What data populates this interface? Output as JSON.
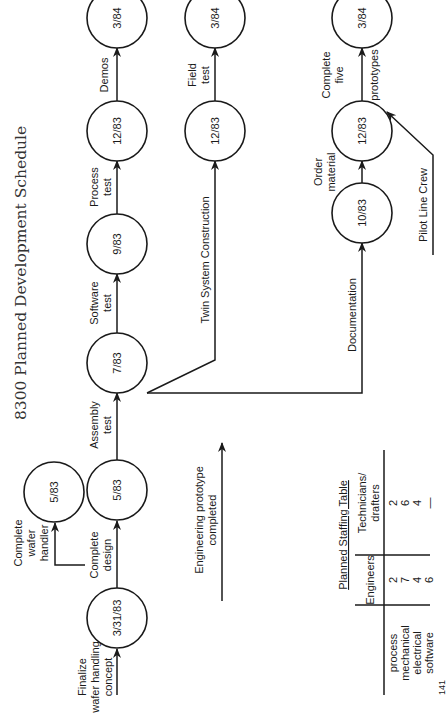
{
  "title": "8300 Planned Development Schedule",
  "orientation": "rotated-90-ccw",
  "nodes": {
    "finalize": "3/31/83",
    "wafer_handler": "5/83",
    "design": "5/83",
    "assembly": "7/83",
    "software": "9/83",
    "process": "12/83",
    "demos": "3/84",
    "twin": "12/83",
    "field": "3/84",
    "documentation": "10/83",
    "order": "12/83",
    "prototypes": "3/84"
  },
  "activities": {
    "finalize": [
      "Finalize",
      "wafer handling",
      "concept"
    ],
    "wafer_handler": [
      "Complete",
      "wafer",
      "handler"
    ],
    "design": [
      "Complete",
      "design"
    ],
    "assembly": [
      "Assembly",
      "test"
    ],
    "software": [
      "Software",
      "test"
    ],
    "process": [
      "Process",
      "test"
    ],
    "demos": [
      "Demos"
    ],
    "twin": "Twin System Construction",
    "field": [
      "Field",
      "test"
    ],
    "documentation": "Documentation",
    "order": [
      "Order",
      "material"
    ],
    "prototypes": [
      "Complete",
      "five",
      "prototypes"
    ],
    "pilot": "Pilot Line Crew",
    "engineering": [
      "Engineering prototype",
      "completed"
    ]
  },
  "staffing_table": {
    "title": "Planned Staffing Table",
    "headers": [
      "",
      "Engineers",
      "Technicians/",
      "drafters"
    ],
    "rows": [
      {
        "discipline": "process",
        "engineers": "2",
        "technicians": "2"
      },
      {
        "discipline": "mechanical",
        "engineers": "7",
        "technicians": "6"
      },
      {
        "discipline": "electrical",
        "engineers": "4",
        "technicians": "4"
      },
      {
        "discipline": "software",
        "engineers": "6",
        "technicians": "—"
      }
    ]
  },
  "page_marker": "141"
}
